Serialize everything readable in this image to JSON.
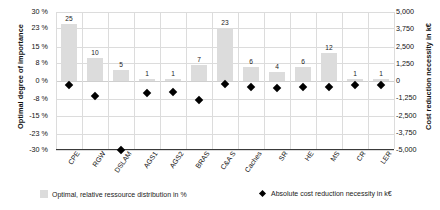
{
  "chart_data": {
    "type": "bar",
    "title": "",
    "categories": [
      "CPE",
      "RGW",
      "DSLAM",
      "AGS1",
      "AGS2",
      "BRAS",
      "C&A S",
      "Caches",
      "SR",
      "HE",
      "MS",
      "CR",
      "LER"
    ],
    "series": [
      {
        "name": "Optimal, relative ressource distribution in %",
        "type": "bar",
        "axis": "left",
        "unit": "%",
        "color": "#dcdcdc",
        "values": [
          25,
          10,
          5,
          1,
          1,
          7,
          23,
          6,
          4,
          6,
          12,
          1,
          1
        ]
      },
      {
        "name": "Absolute cost reduction necessity in k€",
        "type": "scatter",
        "axis": "right",
        "unit": "k€",
        "color": "#000000",
        "values": [
          -300,
          -1100,
          -5000,
          -900,
          -800,
          -1400,
          -250,
          -450,
          -500,
          -450,
          -400,
          -300,
          -300
        ]
      }
    ],
    "xlabel": "",
    "ylabel": "Optimal degree of importance",
    "y2label": "Cost reduction necessity in k€",
    "ylim": [
      -30,
      30
    ],
    "y2lim": [
      -5000,
      5000
    ],
    "yticks": [
      "30 %",
      "23 %",
      "15 %",
      "8 %",
      "0 %",
      "-8 %",
      "-15 %",
      "-23 %",
      "-30 %"
    ],
    "ytick_values": [
      30,
      23,
      15,
      8,
      0,
      -8,
      -15,
      -23,
      -30
    ],
    "y2ticks": [
      "5,000",
      "3,750",
      "2,500",
      "1,250",
      "0",
      "-1,250",
      "-2,500",
      "-3,750",
      "-5,000"
    ],
    "y2tick_values": [
      5000,
      3750,
      2500,
      1250,
      0,
      -1250,
      -2500,
      -3750,
      -5000
    ],
    "grid": true,
    "legend_position": "bottom"
  },
  "axes": {
    "left_title": "Optimal degree of importance",
    "right_title": "Cost reduction necessity in k€"
  },
  "legend": {
    "items": [
      {
        "label": "Optimal, relative ressource distribution in %",
        "marker": "bar-swatch-icon"
      },
      {
        "label": "Absolute cost reduction necessity in k€",
        "marker": "diamond-marker-icon"
      }
    ]
  }
}
